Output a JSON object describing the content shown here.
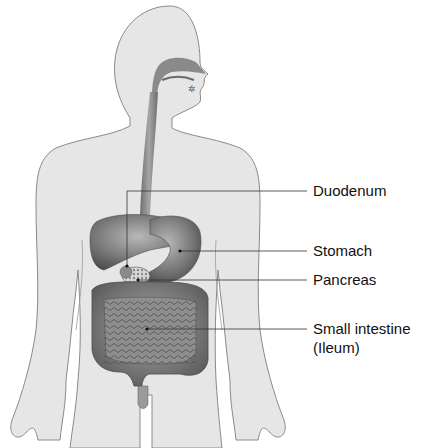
{
  "figure": {
    "body_fill": "#e6e6e6",
    "body_outline": "#8a8a8a",
    "organ_fill": "#7c7c7c",
    "leader_color": "#333333"
  },
  "labels": [
    {
      "id": "duodenum",
      "text": "Duodenum"
    },
    {
      "id": "stomach",
      "text": "Stomach"
    },
    {
      "id": "pancreas",
      "text": "Pancreas"
    },
    {
      "id": "small_intestine",
      "text": "Small intestine"
    },
    {
      "id": "small_intestine_sub",
      "text": "(Ileum)"
    }
  ]
}
